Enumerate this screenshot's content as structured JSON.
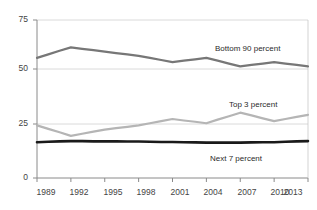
{
  "chart_data": {
    "type": "line",
    "title": "",
    "subtitle": "",
    "xlabel": "",
    "ylabel": "",
    "xlim": [
      1989,
      2013
    ],
    "ylim": [
      0,
      75
    ],
    "yticks": [
      0,
      25,
      50,
      75
    ],
    "ytick_labels": [
      "0",
      "25",
      "50",
      "75"
    ],
    "xticks": [
      1989,
      1992,
      1995,
      1998,
      2001,
      2004,
      2007,
      2010,
      2013
    ],
    "xtick_labels": [
      "1989",
      "1992",
      "1995",
      "1998",
      "2001",
      "2004",
      "2007",
      "2010",
      "2013"
    ],
    "grid": "horizontal",
    "legend_position": "inline-annotations",
    "x": [
      1989,
      1990,
      1991,
      1992,
      1993,
      1994,
      1995,
      1996,
      1997,
      1998,
      1999,
      2000,
      2001,
      2002,
      2003,
      2004,
      2005,
      2006,
      2007,
      2008,
      2009,
      2010,
      2011,
      2012,
      2013
    ],
    "series": [
      {
        "name": "Bottom 90 percent",
        "color": "#777777",
        "width": 2.2,
        "values": [
          57.0,
          58.7,
          60.4,
          62.0,
          61.3,
          60.7,
          60.0,
          59.3,
          58.7,
          58.0,
          57.0,
          56.0,
          55.0,
          55.7,
          56.3,
          57.0,
          55.7,
          54.3,
          53.0,
          53.7,
          54.3,
          55.0,
          54.3,
          53.7,
          53.0
        ],
        "label_x": 2007,
        "label_y": 60
      },
      {
        "name": "Top 3 percent",
        "color": "#b5b5b5",
        "width": 2.2,
        "values": [
          25.0,
          23.3,
          21.7,
          20.0,
          21.0,
          22.0,
          23.0,
          23.7,
          24.3,
          25.0,
          26.0,
          27.0,
          28.0,
          27.3,
          26.7,
          26.0,
          27.7,
          29.3,
          31.0,
          29.7,
          28.3,
          27.0,
          28.0,
          29.0,
          30.0
        ],
        "label_x": 2007,
        "label_y": 36
      },
      {
        "name": "Next 7 percent",
        "color": "#1a1a1a",
        "width": 2.6,
        "values": [
          17.0,
          17.2,
          17.4,
          17.5,
          17.5,
          17.4,
          17.4,
          17.4,
          17.3,
          17.3,
          17.2,
          17.1,
          17.1,
          17.0,
          16.9,
          16.8,
          16.8,
          16.8,
          16.8,
          16.9,
          17.0,
          17.0,
          17.2,
          17.4,
          17.5
        ],
        "label_x": 2007,
        "label_y": 10
      }
    ]
  },
  "axis": {
    "ytick_0": "0",
    "ytick_25": "25",
    "ytick_50": "50",
    "ytick_75": "75",
    "xtick_0": "1989",
    "xtick_1": "1992",
    "xtick_2": "1995",
    "xtick_3": "1998",
    "xtick_4": "2001",
    "xtick_5": "2004",
    "xtick_6": "2007",
    "xtick_7": "2010",
    "xtick_8": "2013"
  },
  "labels": {
    "bottom90": "Bottom 90 percent",
    "top3": "Top 3 percent",
    "next7": "Next 7 percent"
  },
  "colors": {
    "bottom90": "#777777",
    "top3": "#b5b5b5",
    "next7": "#1a1a1a",
    "axis": "#9a9a9a",
    "grid": "#d0d0d0",
    "text": "#444444"
  }
}
